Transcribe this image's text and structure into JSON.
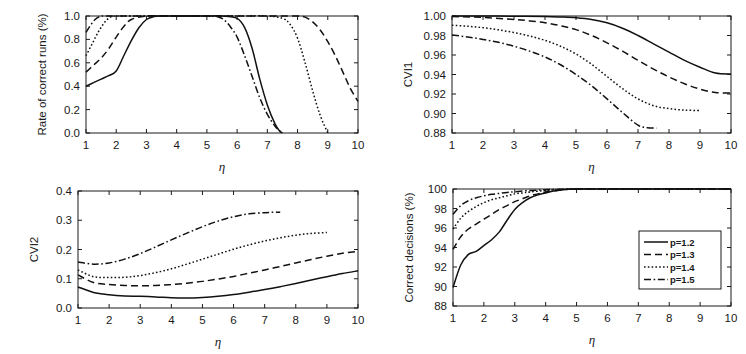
{
  "figure": {
    "background": "#ffffff",
    "line_color": "#111111",
    "panel_count": 4
  },
  "legend": {
    "position": "bottom-right-panel-inside",
    "entries": [
      {
        "label": "p=1.2",
        "style": "solid"
      },
      {
        "label": "p=1.3",
        "style": "dashed"
      },
      {
        "label": "p=1.4",
        "style": "dotted"
      },
      {
        "label": "p=1.5",
        "style": "dashdot"
      }
    ]
  },
  "chart_data": [
    {
      "id": "rate-of-correct-runs",
      "type": "line",
      "title": "",
      "xlabel": "η",
      "ylabel": "Rate of correct runs (%)",
      "xlim": [
        1,
        10
      ],
      "ylim": [
        0.0,
        1.0
      ],
      "xticks": [
        1,
        2,
        3,
        4,
        5,
        6,
        7,
        8,
        9,
        10
      ],
      "yticks": [
        0.0,
        0.2,
        0.4,
        0.6,
        0.8,
        1.0
      ],
      "ytick_labels": [
        "0.0",
        "0.2",
        "0.4",
        "0.6",
        "0.8",
        "1.0"
      ],
      "grid": false,
      "legend_position": "none",
      "series": [
        {
          "name": "p=1.2",
          "style": "solid",
          "x": [
            1.0,
            1.25,
            1.5,
            1.75,
            2.0,
            2.25,
            2.5,
            2.75,
            3.0,
            3.25,
            3.5,
            4.0,
            4.5,
            5.0,
            5.5,
            6.0,
            6.25,
            6.5,
            6.75,
            7.0,
            7.25,
            7.4,
            7.5
          ],
          "values": [
            0.4,
            0.43,
            0.46,
            0.49,
            0.53,
            0.66,
            0.79,
            0.9,
            0.97,
            0.995,
            1.0,
            1.0,
            1.0,
            1.0,
            1.0,
            0.98,
            0.9,
            0.72,
            0.46,
            0.24,
            0.08,
            0.02,
            0.0
          ]
        },
        {
          "name": "p=1.3",
          "style": "dashed",
          "x": [
            1.0,
            1.25,
            1.5,
            1.75,
            2.0,
            2.25,
            2.5,
            3.0,
            4.0,
            5.0,
            6.0,
            7.0,
            7.5,
            8.0,
            8.25,
            8.5,
            8.75,
            9.0,
            9.25,
            9.5,
            9.75,
            10.0
          ],
          "values": [
            0.52,
            0.58,
            0.64,
            0.72,
            0.82,
            0.91,
            0.97,
            1.0,
            1.0,
            1.0,
            1.0,
            1.0,
            1.0,
            1.0,
            0.99,
            0.95,
            0.88,
            0.78,
            0.66,
            0.52,
            0.38,
            0.27
          ]
        },
        {
          "name": "p=1.4",
          "style": "dotted",
          "x": [
            1.0,
            1.2,
            1.4,
            1.6,
            1.8,
            2.0,
            2.5,
            3.0,
            4.0,
            5.0,
            6.0,
            7.0,
            7.5,
            7.75,
            8.0,
            8.25,
            8.5,
            8.75,
            9.0
          ],
          "values": [
            0.66,
            0.76,
            0.86,
            0.94,
            0.99,
            1.0,
            1.0,
            1.0,
            1.0,
            1.0,
            1.0,
            1.0,
            0.98,
            0.93,
            0.81,
            0.6,
            0.36,
            0.15,
            0.0
          ]
        },
        {
          "name": "p=1.5",
          "style": "dashdot",
          "x": [
            1.0,
            1.15,
            1.3,
            1.45,
            1.6,
            2.0,
            3.0,
            4.0,
            5.0,
            5.4,
            5.6,
            5.8,
            6.0,
            6.25,
            6.5,
            6.75,
            7.0,
            7.25,
            7.4,
            7.5
          ],
          "values": [
            0.86,
            0.92,
            0.97,
            0.995,
            1.0,
            1.0,
            1.0,
            1.0,
            1.0,
            0.99,
            0.96,
            0.9,
            0.82,
            0.66,
            0.48,
            0.3,
            0.16,
            0.06,
            0.02,
            0.0
          ]
        }
      ]
    },
    {
      "id": "cvi1",
      "type": "line",
      "title": "",
      "xlabel": "η",
      "ylabel": "CVI1",
      "xlim": [
        1,
        10
      ],
      "ylim": [
        0.88,
        1.0
      ],
      "xticks": [
        1,
        2,
        3,
        4,
        5,
        6,
        7,
        8,
        9,
        10
      ],
      "yticks": [
        0.88,
        0.9,
        0.92,
        0.94,
        0.96,
        0.98,
        1.0
      ],
      "ytick_labels": [
        "0.88",
        "0.90",
        "0.92",
        "0.94",
        "0.96",
        "0.98",
        "1.00"
      ],
      "grid": false,
      "legend_position": "none",
      "series": [
        {
          "name": "p=1.2",
          "style": "solid",
          "x": [
            1,
            2,
            3,
            4,
            4.5,
            5,
            5.5,
            6,
            6.5,
            7,
            7.5,
            8,
            8.5,
            9,
            9.5,
            10
          ],
          "values": [
            1.0,
            1.0,
            0.9998,
            0.9995,
            0.999,
            0.9982,
            0.9965,
            0.993,
            0.9875,
            0.98,
            0.9715,
            0.963,
            0.9545,
            0.9475,
            0.9415,
            0.9405
          ]
        },
        {
          "name": "p=1.3",
          "style": "dashed",
          "x": [
            1,
            2,
            3,
            3.5,
            4,
            4.5,
            5,
            5.5,
            6,
            6.5,
            7,
            7.5,
            8,
            8.5,
            9,
            9.5,
            10
          ],
          "values": [
            0.9995,
            0.9985,
            0.9965,
            0.995,
            0.993,
            0.99,
            0.986,
            0.98,
            0.9725,
            0.964,
            0.9545,
            0.9455,
            0.9375,
            0.9305,
            0.925,
            0.9215,
            0.921
          ]
        },
        {
          "name": "p=1.4",
          "style": "dotted",
          "x": [
            1,
            1.5,
            2,
            2.5,
            3,
            3.5,
            4,
            4.5,
            5,
            5.5,
            6,
            6.5,
            7,
            7.5,
            8,
            8.5,
            9
          ],
          "values": [
            0.9905,
            0.9895,
            0.988,
            0.9858,
            0.983,
            0.9795,
            0.975,
            0.969,
            0.961,
            0.9505,
            0.938,
            0.9255,
            0.915,
            0.908,
            0.905,
            0.9035,
            0.903
          ]
        },
        {
          "name": "p=1.5",
          "style": "dashdot",
          "x": [
            1,
            1.5,
            2,
            2.5,
            3,
            3.5,
            4,
            4.5,
            5,
            5.5,
            6,
            6.5,
            7,
            7.3,
            7.6
          ],
          "values": [
            0.9805,
            0.9785,
            0.976,
            0.973,
            0.969,
            0.964,
            0.958,
            0.95,
            0.94,
            0.9285,
            0.915,
            0.901,
            0.888,
            0.8855,
            0.885
          ]
        }
      ]
    },
    {
      "id": "cvi2",
      "type": "line",
      "title": "",
      "xlabel": "η",
      "ylabel": "CVI2",
      "xlim": [
        1,
        10
      ],
      "ylim": [
        0.0,
        0.4
      ],
      "xticks": [
        1,
        2,
        3,
        4,
        5,
        6,
        7,
        8,
        9,
        10
      ],
      "yticks": [
        0.0,
        0.1,
        0.2,
        0.3,
        0.4
      ],
      "ytick_labels": [
        "0.0",
        "0.1",
        "0.2",
        "0.3",
        "0.4"
      ],
      "grid": false,
      "legend_position": "none",
      "series": [
        {
          "name": "p=1.2",
          "style": "solid",
          "x": [
            1,
            1.5,
            2,
            2.5,
            3,
            3.5,
            4,
            4.5,
            5,
            5.5,
            6,
            6.5,
            7,
            7.5,
            8,
            8.5,
            9,
            9.5,
            10
          ],
          "values": [
            0.072,
            0.053,
            0.045,
            0.041,
            0.04,
            0.038,
            0.035,
            0.034,
            0.036,
            0.04,
            0.046,
            0.054,
            0.063,
            0.073,
            0.084,
            0.096,
            0.107,
            0.118,
            0.127
          ]
        },
        {
          "name": "p=1.3",
          "style": "dashed",
          "x": [
            1,
            1.5,
            2,
            2.5,
            3,
            3.5,
            4,
            4.5,
            5,
            5.5,
            6,
            6.5,
            7,
            7.5,
            8,
            8.5,
            9,
            9.5,
            10
          ],
          "values": [
            0.113,
            0.087,
            0.08,
            0.077,
            0.076,
            0.077,
            0.08,
            0.085,
            0.091,
            0.099,
            0.108,
            0.119,
            0.13,
            0.142,
            0.154,
            0.166,
            0.177,
            0.187,
            0.194
          ]
        },
        {
          "name": "p=1.4",
          "style": "dotted",
          "x": [
            1,
            1.5,
            2,
            2.5,
            3,
            3.5,
            4,
            4.5,
            5,
            5.5,
            6,
            6.5,
            7,
            7.5,
            8,
            8.5,
            9
          ],
          "values": [
            0.13,
            0.107,
            0.104,
            0.105,
            0.111,
            0.121,
            0.134,
            0.15,
            0.167,
            0.184,
            0.201,
            0.216,
            0.229,
            0.24,
            0.249,
            0.255,
            0.258
          ]
        },
        {
          "name": "p=1.5",
          "style": "dashdot",
          "x": [
            1,
            1.5,
            2,
            2.5,
            3,
            3.5,
            4,
            4.5,
            5,
            5.5,
            6,
            6.5,
            7,
            7.25,
            7.5
          ],
          "values": [
            0.157,
            0.15,
            0.154,
            0.167,
            0.186,
            0.209,
            0.233,
            0.256,
            0.278,
            0.297,
            0.312,
            0.322,
            0.326,
            0.327,
            0.327
          ]
        }
      ]
    },
    {
      "id": "correct-decisions",
      "type": "line",
      "title": "",
      "xlabel": "η",
      "ylabel": "Correct decisions (%)",
      "xlim": [
        1,
        10
      ],
      "ylim": [
        88,
        100
      ],
      "xticks": [
        1,
        2,
        3,
        4,
        5,
        6,
        7,
        8,
        9,
        10
      ],
      "yticks": [
        88,
        90,
        92,
        94,
        96,
        98,
        100
      ],
      "ytick_labels": [
        "88",
        "90",
        "92",
        "94",
        "96",
        "98",
        "100"
      ],
      "grid": false,
      "legend_position": "inside-right",
      "series": [
        {
          "name": "p=1.2",
          "style": "solid",
          "x": [
            1.0,
            1.25,
            1.5,
            1.75,
            2.0,
            2.25,
            2.5,
            2.75,
            3.0,
            3.25,
            3.5,
            3.75,
            4.0,
            4.25,
            4.5,
            4.75,
            5.0,
            6,
            7,
            8,
            9,
            10
          ],
          "values": [
            89.9,
            92.2,
            93.3,
            93.6,
            94.2,
            94.8,
            95.6,
            96.8,
            97.9,
            98.6,
            99.1,
            99.4,
            99.6,
            99.8,
            99.9,
            99.97,
            100,
            100,
            100,
            100,
            100,
            100
          ]
        },
        {
          "name": "p=1.3",
          "style": "dashed",
          "x": [
            1.0,
            1.25,
            1.5,
            1.75,
            2.0,
            2.25,
            2.5,
            2.75,
            3.0,
            3.25,
            3.5,
            3.75,
            4.0,
            4.5,
            5.0,
            6,
            7,
            8,
            9,
            10
          ],
          "values": [
            93.8,
            95.1,
            95.9,
            96.4,
            96.9,
            97.4,
            97.9,
            98.3,
            98.7,
            99.0,
            99.3,
            99.5,
            99.7,
            99.9,
            100,
            100,
            100,
            100,
            100,
            100
          ]
        },
        {
          "name": "p=1.4",
          "style": "dotted",
          "x": [
            1.0,
            1.25,
            1.5,
            1.75,
            2.0,
            2.25,
            2.5,
            2.75,
            3.0,
            3.25,
            3.5,
            4.0,
            4.5,
            5.0,
            6,
            7,
            8,
            9,
            10
          ],
          "values": [
            95.9,
            97.0,
            97.7,
            98.2,
            98.6,
            98.9,
            99.1,
            99.3,
            99.5,
            99.6,
            99.7,
            99.85,
            99.95,
            100,
            100,
            100,
            100,
            100,
            100
          ]
        },
        {
          "name": "p=1.5",
          "style": "dashdot",
          "x": [
            1.0,
            1.25,
            1.5,
            1.75,
            2.0,
            2.25,
            2.5,
            2.75,
            3.0,
            3.5,
            4.0,
            4.5,
            5.0,
            6,
            7,
            8,
            9,
            10
          ],
          "values": [
            97.4,
            98.3,
            98.8,
            99.1,
            99.3,
            99.45,
            99.55,
            99.65,
            99.72,
            99.85,
            99.92,
            99.97,
            100,
            100,
            100,
            100,
            100,
            100
          ]
        }
      ]
    }
  ]
}
